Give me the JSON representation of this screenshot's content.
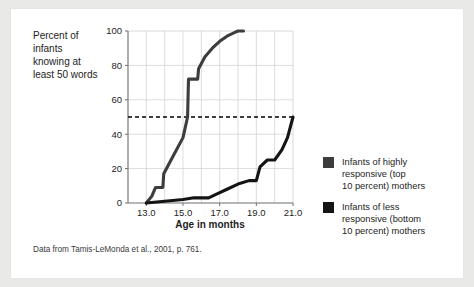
{
  "figure": {
    "caption": "Data from Tamis-LeMonda et al., 2001, p. 761.",
    "background_color": "#ffffff",
    "page_color": "#e9e9e7"
  },
  "chart_data": {
    "type": "line",
    "title": "",
    "xlabel": "Age in months",
    "ylabel": "Percent of infants knowing at least 50 words",
    "ylabel_lines": [
      "Percent of",
      "infants",
      "knowing at",
      "least 50 words"
    ],
    "xlim": [
      12.0,
      21.0
    ],
    "ylim": [
      0,
      100
    ],
    "xticks": [
      13.0,
      15.0,
      17.0,
      19.0,
      21.0
    ],
    "xtick_labels": [
      "13.0",
      "15.0",
      "17.0",
      "19.0",
      "21.0"
    ],
    "yticks": [
      0,
      20,
      40,
      60,
      80,
      100
    ],
    "ytick_labels": [
      "0",
      "20",
      "40",
      "60",
      "80",
      "100"
    ],
    "grid": true,
    "grid_color": "#cfcfcf",
    "axis_color": "#6e6e6e",
    "legend_position": "right-outside",
    "annotations": [
      {
        "name": "fifty-percent-reference-line",
        "type": "horizontal-dashed-line",
        "y": 50,
        "color": "#000000",
        "dash": "4,3"
      }
    ],
    "series": [
      {
        "name": "Infants of highly responsive (top 10 percent) mothers",
        "legend_label_lines": [
          "Infants of highly",
          "responsive (top",
          "10 percent) mothers"
        ],
        "color": "#3d3d3d",
        "line_width": 3.1,
        "x": [
          13.0,
          13.3,
          13.5,
          13.9,
          13.95,
          14.5,
          15.0,
          15.25,
          15.3,
          15.8,
          15.85,
          16.2,
          16.6,
          17.0,
          17.4,
          17.8,
          18.0,
          18.3
        ],
        "y": [
          0,
          4,
          9,
          9,
          17,
          28,
          38,
          50,
          72,
          72,
          78,
          85,
          90,
          94,
          97,
          99,
          100,
          100
        ]
      },
      {
        "name": "Infants of less responsive (bottom 10 percent) mothers",
        "legend_label_lines": [
          "Infants of less",
          "responsive (bottom",
          "10 percent) mothers"
        ],
        "color": "#141414",
        "line_width": 3.1,
        "x": [
          13.0,
          14.0,
          15.0,
          15.6,
          16.0,
          16.4,
          16.8,
          17.4,
          18.0,
          18.6,
          19.0,
          19.2,
          19.6,
          20.0,
          20.4,
          20.7,
          21.0
        ],
        "y": [
          0,
          1,
          2,
          3,
          3,
          3,
          5,
          8,
          11,
          13,
          13,
          21,
          25,
          25,
          31,
          38,
          50
        ]
      }
    ]
  },
  "legend": {
    "items": [
      {
        "swatch_color": "#3d3d3d",
        "lines": [
          "Infants of highly",
          "responsive (top",
          "10 percent) mothers"
        ]
      },
      {
        "swatch_color": "#141414",
        "lines": [
          "Infants of less",
          "responsive (bottom",
          "10 percent) mothers"
        ]
      }
    ]
  }
}
